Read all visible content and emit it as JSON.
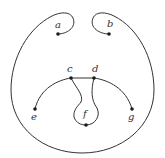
{
  "diagram": {
    "type": "curve-diagram",
    "colors": {
      "stroke": "#333333",
      "dot": "#1a1a1a",
      "background": "#ffffff"
    },
    "points": [
      {
        "id": "a",
        "label": "a",
        "x": 58,
        "y": 34,
        "lx": 55,
        "ly": 28
      },
      {
        "id": "b",
        "label": "b",
        "x": 109,
        "y": 34,
        "lx": 107,
        "ly": 27
      },
      {
        "id": "c",
        "label": "c",
        "x": 71,
        "y": 78,
        "lx": 67,
        "ly": 72
      },
      {
        "id": "d",
        "label": "d",
        "x": 94,
        "y": 78,
        "lx": 92,
        "ly": 72
      },
      {
        "id": "e",
        "label": "e",
        "x": 35,
        "y": 109,
        "lx": 31,
        "ly": 120
      },
      {
        "id": "f",
        "label": "f",
        "x": 86,
        "y": 125,
        "lx": 83,
        "ly": 117
      },
      {
        "id": "g",
        "label": "g",
        "x": 132,
        "y": 109,
        "lx": 128,
        "ly": 120
      }
    ],
    "curves": [
      {
        "id": "outer-loop",
        "d": "M 58 34 C 66 34, 77 28, 73 18 C 70 11, 60 12, 52 16 C 28 28, 11 58, 11 90 C 11 128, 44 153, 82 153 C 122 153, 154 126, 154 90 C 154 58, 138 28, 114 16 C 106 12, 96 11, 93 18 C 89 28, 100 34, 109 34"
      },
      {
        "id": "arc-e-g",
        "d": "M 35 109 C 40 88, 58 80, 71 78 L 94 78 C 108 80, 126 88, 132 109"
      },
      {
        "id": "path-c-f",
        "d": "M 71 78 C 76 88, 84 95, 81 102 C 78 106, 73 110, 74 117 C 76 123, 81 125, 86 125"
      },
      {
        "id": "path-d-f",
        "d": "M 94 78 C 91 90, 91 100, 97 108 C 101 116, 95 125, 86 125"
      }
    ]
  }
}
